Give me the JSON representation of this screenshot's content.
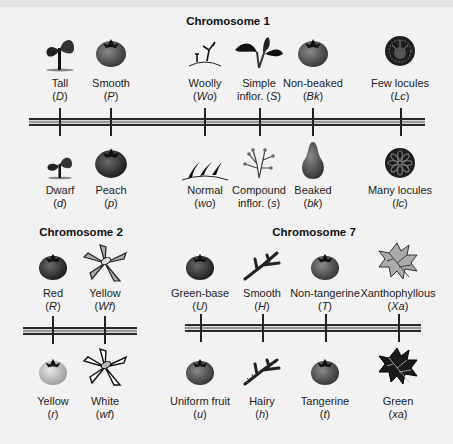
{
  "chromosomes": [
    {
      "title": "Chromosome 1",
      "dominant": [
        {
          "trait": "Tall",
          "allele": "D",
          "icon": "tall-plant-icon"
        },
        {
          "trait": "Smooth",
          "allele": "P",
          "icon": "smooth-fruit-icon"
        },
        {
          "trait": "Woolly",
          "allele": "Wo",
          "icon": "woolly-hair-icon"
        },
        {
          "trait": "Simple",
          "trait2": "inflor.",
          "allele": "S",
          "icon": "simple-inflorescence-icon"
        },
        {
          "trait": "Non-beaked",
          "allele": "Bk",
          "icon": "non-beaked-fruit-icon"
        },
        {
          "trait": "Few locules",
          "allele": "Lc",
          "icon": "few-locules-icon"
        }
      ],
      "recessive": [
        {
          "trait": "Dwarf",
          "allele": "d",
          "icon": "dwarf-plant-icon"
        },
        {
          "trait": "Peach",
          "allele": "p",
          "icon": "peach-fruit-icon"
        },
        {
          "trait": "Normal",
          "allele": "wo",
          "icon": "normal-hair-icon"
        },
        {
          "trait": "Compound",
          "trait2": "inflor.",
          "allele": "s",
          "icon": "compound-inflorescence-icon"
        },
        {
          "trait": "Beaked",
          "allele": "bk",
          "icon": "beaked-fruit-icon"
        },
        {
          "trait": "Many locules",
          "allele": "lc",
          "icon": "many-locules-icon"
        }
      ]
    },
    {
      "title": "Chromosome 2",
      "dominant": [
        {
          "trait": "Red",
          "allele": "R",
          "icon": "red-fruit-icon"
        },
        {
          "trait": "Yellow",
          "allele": "Wf",
          "icon": "yellow-flower-icon"
        }
      ],
      "recessive": [
        {
          "trait": "Yellow",
          "allele": "r",
          "icon": "yellow-fruit-icon"
        },
        {
          "trait": "White",
          "allele": "wf",
          "icon": "white-flower-icon"
        }
      ]
    },
    {
      "title": "Chromosome 7",
      "dominant": [
        {
          "trait": "Green-base",
          "allele": "U",
          "icon": "green-base-fruit-icon"
        },
        {
          "trait": "Smooth",
          "allele": "H",
          "icon": "smooth-stem-icon"
        },
        {
          "trait": "Non-tangerine",
          "allele": "T",
          "icon": "non-tangerine-fruit-icon"
        },
        {
          "trait": "Xanthophyllous",
          "allele": "Xa",
          "icon": "xanthophyllous-leaf-icon"
        }
      ],
      "recessive": [
        {
          "trait": "Uniform fruit",
          "allele": "u",
          "icon": "uniform-fruit-icon"
        },
        {
          "trait": "Hairy",
          "allele": "h",
          "icon": "hairy-stem-icon"
        },
        {
          "trait": "Tangerine",
          "allele": "t",
          "icon": "tangerine-fruit-icon"
        },
        {
          "trait": "Green",
          "allele": "xa",
          "icon": "green-leaf-icon"
        }
      ]
    }
  ],
  "colors": {
    "background": "#f2f2f2",
    "chromosome_dark": "#2a2a2a",
    "chromosome_mid": "#9a9a9a"
  }
}
